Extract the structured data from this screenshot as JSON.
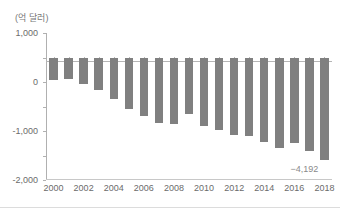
{
  "chart_data": {
    "type": "bar",
    "title": "",
    "subtitle": "",
    "unit_label": "(억 달러)",
    "xlabel": "",
    "ylabel": "",
    "ylim": [
      -5000,
      1000
    ],
    "ytick_values": [
      1000,
      0,
      -1000,
      -2000,
      -3000,
      -4000,
      -5000
    ],
    "ytick_labels": [
      "1,000",
      "0",
      "-1,000",
      "-2,000",
      "-3,000",
      "-4,000",
      "-5,000"
    ],
    "grid": false,
    "legend": null,
    "bar_color": "#808080",
    "axis_color": "#b0b0b0",
    "text_color": "#6b6b6b",
    "categories": [
      "2000",
      "2001",
      "2002",
      "2003",
      "2004",
      "2005",
      "2006",
      "2007",
      "2008",
      "2009",
      "2010",
      "2011",
      "2012",
      "2013",
      "2014",
      "2015",
      "2016",
      "2017",
      "2018"
    ],
    "xtick_labels": [
      "2000",
      "2002",
      "2004",
      "2006",
      "2008",
      "2010",
      "2012",
      "2014",
      "2016",
      "2018"
    ],
    "values": [
      -900,
      -880,
      -1080,
      -1320,
      -1700,
      -2100,
      -2390,
      -2660,
      -2720,
      -2320,
      -2790,
      -2950,
      -3180,
      -3190,
      -3440,
      -3700,
      -3500,
      -3800,
      -4192
    ],
    "annotations": [
      {
        "category": "2018",
        "text": "−4,192",
        "value": -4192
      }
    ]
  }
}
